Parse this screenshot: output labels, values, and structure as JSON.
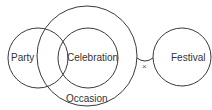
{
  "diagram": {
    "type": "set-relationship",
    "colors": {
      "background": "#ffffff",
      "stroke": "#3a3a3a",
      "text": "#333333"
    },
    "sets": [
      {
        "id": "party",
        "label": "Party",
        "cx": 38,
        "cy": 58,
        "r": 30
      },
      {
        "id": "celebration",
        "label": "Celebration",
        "cx": 88,
        "cy": 58,
        "r": 30
      },
      {
        "id": "occasion",
        "label": "Occasion",
        "cx": 87,
        "cy": 56,
        "r": 50
      },
      {
        "id": "festival",
        "label": "Festival",
        "cx": 182,
        "cy": 57,
        "r": 29
      }
    ],
    "relations": [
      {
        "from": "occasion",
        "to": "festival",
        "symbol": "×",
        "meaning": "no relation / disjoint"
      }
    ],
    "labels": {
      "party": "Party",
      "celebration": "Celebration",
      "occasion": "Occasion",
      "festival": "Festival",
      "disjoint_mark": "×"
    }
  }
}
